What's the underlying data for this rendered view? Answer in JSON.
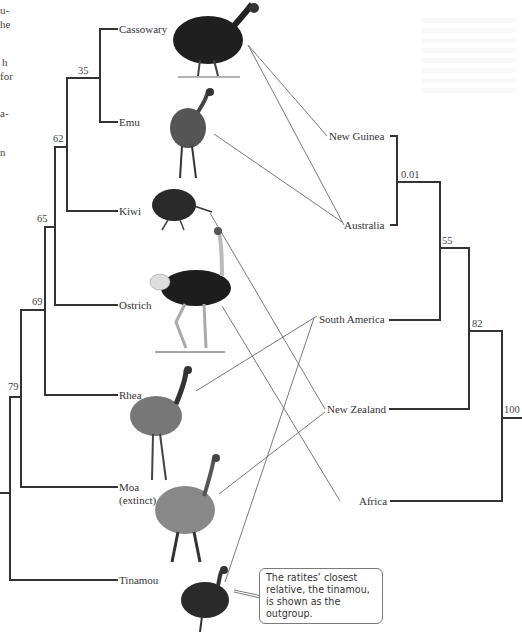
{
  "figure": {
    "type": "phylogenetic-tree-with-biogeography",
    "cut_off_text_left": [
      "u-",
      "he",
      "",
      "h",
      "for",
      "",
      "a-",
      "",
      "n"
    ]
  },
  "species_tree": {
    "taxa": [
      {
        "name": "Cassowary",
        "y": 29
      },
      {
        "name": "Emu",
        "y": 122
      },
      {
        "name": "Kiwi",
        "y": 211
      },
      {
        "name": "Ostrich",
        "y": 305
      },
      {
        "name": "Rhea",
        "y": 395
      },
      {
        "name": "Moa",
        "line2": "(extinct)",
        "y": 487
      },
      {
        "name": "Tinamou",
        "y": 580
      }
    ],
    "node_support": [
      {
        "value": "35",
        "joins": [
          "Cassowary",
          "Emu"
        ]
      },
      {
        "value": "62",
        "joins": [
          "Cassowary+Emu",
          "Kiwi"
        ]
      },
      {
        "value": "65",
        "joins": [
          "Australasian clade",
          "Ostrich"
        ]
      },
      {
        "value": "69",
        "joins": [
          "...",
          "Rhea"
        ]
      },
      {
        "value": "79",
        "joins": [
          "...",
          "Moa"
        ]
      }
    ],
    "outgroup": "Tinamou"
  },
  "area_tree": {
    "areas": [
      {
        "name": "New Guinea",
        "y": 136
      },
      {
        "name": "Australia",
        "y": 225
      },
      {
        "name": "South America",
        "y": 320
      },
      {
        "name": "New Zealand",
        "y": 409
      },
      {
        "name": "Africa",
        "y": 501
      }
    ],
    "node_support": [
      {
        "value": "0.01",
        "joins": [
          "New Guinea",
          "Australia"
        ]
      },
      {
        "value": "55",
        "joins": [
          "New Guinea+Australia",
          "South America"
        ]
      },
      {
        "value": "82",
        "joins": [
          "...",
          "New Zealand"
        ]
      },
      {
        "value": "100",
        "joins": [
          "...",
          "Africa"
        ]
      }
    ]
  },
  "mappings": [
    {
      "bird": "Cassowary",
      "areas": [
        "New Guinea",
        "Australia"
      ]
    },
    {
      "bird": "Emu",
      "areas": [
        "Australia"
      ]
    },
    {
      "bird": "Kiwi",
      "areas": [
        "New Zealand"
      ]
    },
    {
      "bird": "Ostrich",
      "areas": [
        "Africa"
      ]
    },
    {
      "bird": "Rhea",
      "areas": [
        "South America"
      ]
    },
    {
      "bird": "Moa",
      "areas": [
        "New Zealand"
      ]
    },
    {
      "bird": "Tinamou",
      "areas": [
        "South America"
      ]
    }
  ],
  "callout": {
    "text": "The ratites’ closest relative, the tinamou, is shown as the outgroup."
  },
  "icons": {
    "cassowary": "cassowary-illustration",
    "emu": "emu-illustration",
    "kiwi": "kiwi-illustration",
    "ostrich": "ostrich-illustration",
    "rhea": "rhea-illustration",
    "moa": "moa-illustration",
    "tinamou": "tinamou-illustration"
  },
  "colors": {
    "branch": "#3a3a3a",
    "connector": "#6a6a6a",
    "text": "#333333",
    "bird_dark": "#222222"
  }
}
